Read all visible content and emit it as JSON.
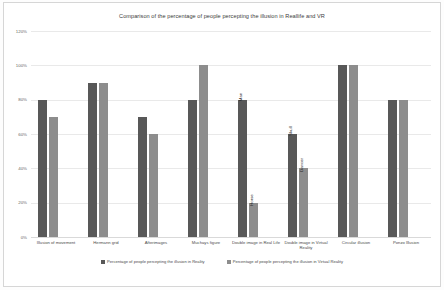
{
  "chart_data": {
    "type": "bar",
    "title": "Comparison of the percentage of people  percepting the illusion in Reallife and VR",
    "xlabel": "",
    "ylabel": "",
    "ylim": [
      0,
      120
    ],
    "ytick_labels": [
      "0%",
      "20%",
      "40%",
      "60%",
      "80%",
      "100%",
      "120%"
    ],
    "ytick_values": [
      0,
      20,
      40,
      60,
      80,
      100,
      120
    ],
    "grid": true,
    "legend_position": "bottom",
    "categories": [
      "Illusion of movement",
      "Hermann grid",
      "Afterimages",
      "Muchays figure",
      "Double image in Real Life",
      "Double image in Virtual Reality",
      "Circular illusion",
      "Ponzo Illusion"
    ],
    "series": [
      {
        "name": "Percentage of people percepting the illusion in Reality",
        "color": "#585858",
        "values": [
          80,
          90,
          70,
          80,
          80,
          60,
          100,
          80
        ]
      },
      {
        "name": "Percentage of people percepting the illusion in Virtual Reality",
        "color": "#8d8d8d",
        "values": [
          70,
          90,
          60,
          100,
          20,
          40,
          100,
          80
        ]
      }
    ],
    "annotations": [
      {
        "group": 4,
        "series": 0,
        "text": "Man"
      },
      {
        "group": 4,
        "series": 1,
        "text": "Horse"
      },
      {
        "group": 5,
        "series": 0,
        "text": "Skull"
      },
      {
        "group": 5,
        "series": 1,
        "text": "Dancer"
      }
    ]
  },
  "legend": {
    "items": [
      {
        "label": "Percentage of people percepting the illusion in Reality",
        "color": "#585858"
      },
      {
        "label": "Percentage of people percepting the illusion in Virtual Reality",
        "color": "#8d8d8d"
      }
    ]
  }
}
